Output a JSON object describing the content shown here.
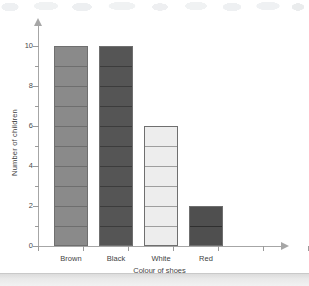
{
  "chart_data": {
    "type": "bar",
    "title": "",
    "subtitle": "",
    "xlabel": "Colour of shoes",
    "ylabel": "Number of children",
    "categories": [
      "Brown",
      "Black",
      "White",
      "Red"
    ],
    "values": [
      10,
      10,
      6,
      2
    ],
    "series": [
      {
        "name": "Number of children",
        "values": [
          10,
          10,
          6,
          2
        ]
      }
    ],
    "ylim": [
      0,
      10
    ],
    "y_major_ticks": [
      0,
      2,
      4,
      6,
      8,
      10
    ],
    "y_minor_ticks": [
      1,
      3,
      5,
      7,
      9
    ],
    "y_tick_labels": [
      "0",
      "2",
      "4",
      "6",
      "8",
      "10"
    ],
    "grid": false,
    "legend": false,
    "legend_position": "none",
    "annotations": [],
    "bar_segment_lines": true,
    "bar_colors": [
      "#8a8a8a",
      "#555555",
      "#ededed",
      "#4f4f4f"
    ],
    "bar_border_color": "#6f6f6f",
    "segment_line_colors": [
      "#6e6e6e",
      "#3c3c3c",
      "#9e9e9e",
      "#2f2f2f"
    ],
    "axis_color": "#a6a6a6",
    "text_color": "#3f3f3f",
    "background_color": "#ffffff"
  }
}
